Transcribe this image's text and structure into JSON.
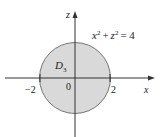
{
  "diagram": {
    "region_label": "D",
    "region_subscript": "3",
    "equation": {
      "x": "x",
      "z": "z",
      "exp": "2",
      "plus": "+",
      "equals": "= 4"
    },
    "axes": {
      "horizontal_label": "x",
      "vertical_label": "z"
    },
    "ticks": {
      "neg": "−2",
      "origin": "0",
      "pos": "2"
    },
    "colors": {
      "fill": "#d9d9d9",
      "stroke": "#333333"
    }
  }
}
